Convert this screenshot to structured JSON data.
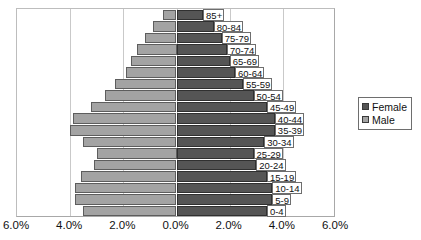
{
  "chart_data": {
    "type": "bar",
    "subtype": "population-pyramid",
    "title": "",
    "xlabel": "",
    "ylabel": "",
    "orientation": "horizontal",
    "grid": true,
    "legend_position": "right",
    "xlim": [
      -6.0,
      6.0
    ],
    "xticks": [
      -6.0,
      -4.0,
      -2.0,
      0.0,
      2.0,
      4.0,
      6.0
    ],
    "xticklabels": [
      "6.0%",
      "4.0%",
      "2.0%",
      "0.0%",
      "2.0%",
      "4.0%",
      "6.0%"
    ],
    "categories": [
      "85+",
      "80-84",
      "75-79",
      "70-74",
      "65-69",
      "60-64",
      "55-59",
      "50-54",
      "45-49",
      "40-44",
      "35-39",
      "30-34",
      "25-29",
      "20-24",
      "15-19",
      "10-14",
      "5-9",
      "0-4"
    ],
    "series": [
      {
        "name": "Male",
        "color": "#a3a3a3",
        "side": "left",
        "values": [
          0.5,
          0.9,
          1.2,
          1.5,
          1.7,
          1.9,
          2.3,
          2.7,
          3.2,
          3.9,
          4.0,
          3.5,
          3.0,
          3.1,
          3.6,
          3.8,
          3.8,
          3.5
        ]
      },
      {
        "name": "Female",
        "color": "#555555",
        "side": "right",
        "values": [
          1.0,
          1.4,
          1.7,
          1.9,
          2.0,
          2.2,
          2.5,
          2.9,
          3.4,
          3.7,
          3.7,
          3.3,
          2.9,
          3.0,
          3.4,
          3.6,
          3.6,
          3.4
        ]
      }
    ]
  },
  "legend": {
    "items": [
      {
        "label": "Female",
        "swatch": "female"
      },
      {
        "label": "Male",
        "swatch": "male"
      }
    ]
  }
}
